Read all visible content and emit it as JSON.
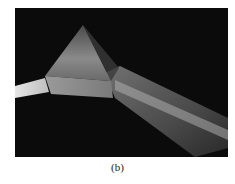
{
  "figure": {
    "caption": "(b)",
    "colors": {
      "background": "#0b0b0b",
      "beam": "#d8d8d8",
      "prism": "#6a6a6a"
    }
  }
}
